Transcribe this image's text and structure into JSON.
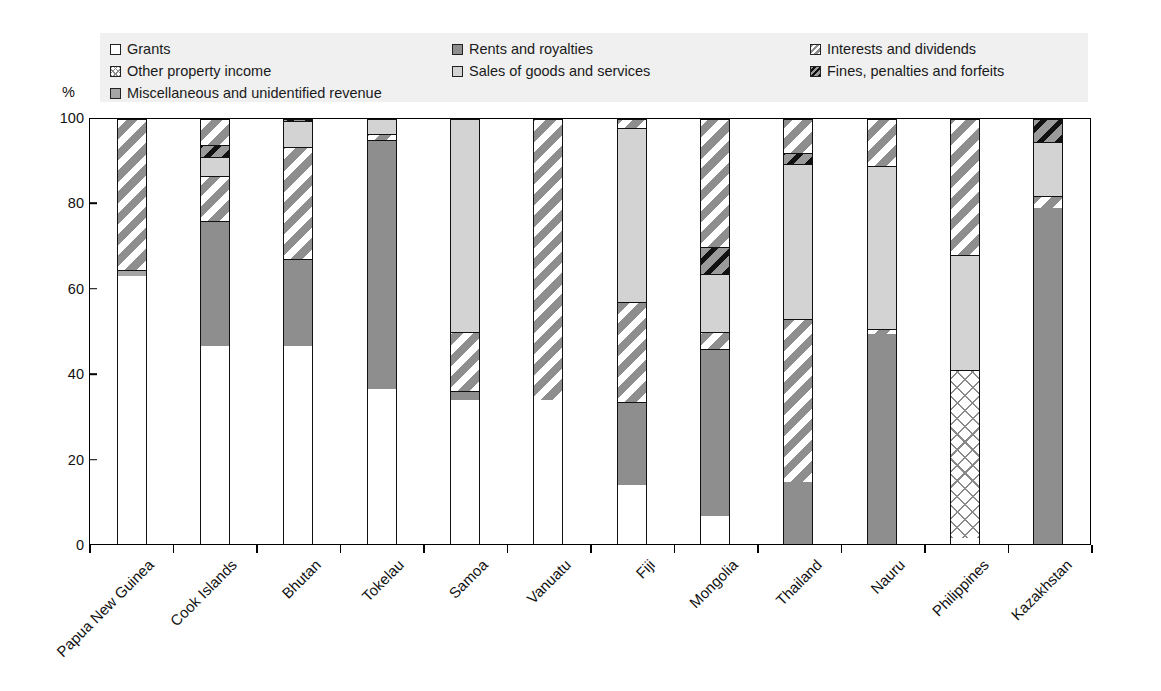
{
  "axis": {
    "unit_label": "%",
    "y_ticks": [
      0,
      20,
      40,
      60,
      80,
      100
    ],
    "y_min": 0,
    "y_max": 100
  },
  "legend": {
    "columns": [
      [
        {
          "label": "Grants",
          "pattern": "p-white",
          "icon": "legend-swatch-grants"
        },
        {
          "label": "Other property income",
          "pattern": "p-crosshatch",
          "icon": "legend-swatch-other-property-income"
        },
        {
          "label": "Miscellaneous and unidentified revenue",
          "pattern": "p-midgray",
          "icon": "legend-swatch-miscellaneous"
        }
      ],
      [
        {
          "label": "Rents and royalties",
          "pattern": "p-solidgray",
          "icon": "legend-swatch-rents-and-royalties"
        },
        {
          "label": "Sales of goods and services",
          "pattern": "p-lightgray",
          "icon": "legend-swatch-sales-of-goods-and-services"
        }
      ],
      [
        {
          "label": "Interests and dividends",
          "pattern": "p-diaghatch",
          "icon": "legend-swatch-interests-and-dividends"
        },
        {
          "label": "Fines, penalties and forfeits",
          "pattern": "p-darkdiag",
          "icon": "legend-swatch-fines-penalties-and-forfeits"
        }
      ]
    ]
  },
  "chart_data": {
    "type": "bar",
    "subtype": "stacked-100-percent",
    "title": "",
    "xlabel": "",
    "ylabel": "%",
    "ylim": [
      0,
      100
    ],
    "grid": false,
    "legend_position": "top",
    "categories": [
      "Papua New Guinea",
      "Cook Islands",
      "Bhutan",
      "Tokelau",
      "Samoa",
      "Vanuatu",
      "Fiji",
      "Mongolia",
      "Thailand",
      "Nauru",
      "Philippines",
      "Kazakhstan"
    ],
    "series": [
      {
        "name": "Grants",
        "pattern": "p-white",
        "values": [
          63.0,
          46.5,
          46.5,
          36.5,
          34.0,
          34.0,
          14.0,
          6.5,
          0.0,
          0.0,
          1.5,
          0.0
        ]
      },
      {
        "name": "Other property income",
        "pattern": "p-crosshatch",
        "values": [
          0.0,
          0.0,
          0.0,
          0.0,
          0.0,
          0.0,
          0.0,
          0.0,
          0.0,
          0.0,
          39.5,
          0.0
        ]
      },
      {
        "name": "Rents and royalties",
        "pattern": "p-solidgray",
        "values": [
          1.0,
          29.5,
          20.5,
          58.5,
          2.0,
          0.0,
          19.5,
          39.5,
          14.5,
          49.5,
          0.0,
          79.0
        ]
      },
      {
        "name": "Sales of goods and services",
        "pattern": "p-lightgray",
        "values": [
          0.0,
          4.5,
          6.0,
          3.5,
          50.0,
          0.0,
          41.0,
          13.5,
          36.5,
          38.5,
          27.0,
          12.5
        ]
      },
      {
        "name": "Interests and dividends",
        "pattern": "p-diaghatch",
        "values": [
          35.0,
          10.5,
          26.5,
          1.5,
          14.0,
          66.0,
          23.5,
          4.0,
          38.5,
          1.0,
          0.0,
          3.0
        ]
      },
      {
        "name": "Fines, penalties and forfeits",
        "pattern": "p-darkdiag",
        "values": [
          0.0,
          3.0,
          0.5,
          0.0,
          0.0,
          0.0,
          0.0,
          6.5,
          2.5,
          0.0,
          0.0,
          5.5
        ]
      },
      {
        "name": "Miscellaneous and unidentified revenue",
        "pattern": "p-midgray",
        "values": [
          1.0,
          6.0,
          0.0,
          0.0,
          0.0,
          0.0,
          2.0,
          30.0,
          8.0,
          11.0,
          32.0,
          0.0
        ]
      }
    ],
    "stack_order": [
      "Grants",
      "Other property income",
      "Rents and royalties",
      "Sales of goods and services",
      "Interests and dividends",
      "Fines, penalties and forfeits",
      "Miscellaneous and unidentified revenue"
    ],
    "per_bar_stacks": [
      {
        "category": "Papua New Guinea",
        "segments": [
          {
            "name": "Grants",
            "pattern": "p-white",
            "from": 0,
            "to": 63
          },
          {
            "name": "Miscellaneous and unidentified revenue",
            "pattern": "p-midgray",
            "from": 63,
            "to": 64.5
          },
          {
            "name": "Interests and dividends",
            "pattern": "p-diaghatch",
            "from": 64.5,
            "to": 100
          }
        ]
      },
      {
        "category": "Cook Islands",
        "segments": [
          {
            "name": "Grants",
            "pattern": "p-white",
            "from": 0,
            "to": 46.5
          },
          {
            "name": "Rents and royalties",
            "pattern": "p-solidgray",
            "from": 46.5,
            "to": 76
          },
          {
            "name": "Interests and dividends",
            "pattern": "p-diaghatch",
            "from": 76,
            "to": 86.5
          },
          {
            "name": "Sales of goods and services",
            "pattern": "p-lightgray",
            "from": 86.5,
            "to": 91
          },
          {
            "name": "Fines, penalties and forfeits",
            "pattern": "p-darkdiag",
            "from": 91,
            "to": 94
          },
          {
            "name": "Miscellaneous and unidentified revenue",
            "pattern": "p-diaghatch",
            "from": 94,
            "to": 100
          }
        ]
      },
      {
        "category": "Bhutan",
        "segments": [
          {
            "name": "Grants",
            "pattern": "p-white",
            "from": 0,
            "to": 46.5
          },
          {
            "name": "Rents and royalties",
            "pattern": "p-solidgray",
            "from": 46.5,
            "to": 67
          },
          {
            "name": "Interests and dividends",
            "pattern": "p-diaghatch",
            "from": 67,
            "to": 93.5
          },
          {
            "name": "Sales of goods and services",
            "pattern": "p-lightgray",
            "from": 93.5,
            "to": 99.5
          },
          {
            "name": "Fines, penalties and forfeits",
            "pattern": "p-darkdiag",
            "from": 99.5,
            "to": 100
          }
        ]
      },
      {
        "category": "Tokelau",
        "segments": [
          {
            "name": "Grants",
            "pattern": "p-white",
            "from": 0,
            "to": 36.5
          },
          {
            "name": "Rents and royalties",
            "pattern": "p-solidgray",
            "from": 36.5,
            "to": 95
          },
          {
            "name": "Interests and dividends",
            "pattern": "p-diaghatch",
            "from": 95,
            "to": 96.5
          },
          {
            "name": "Sales of goods and services",
            "pattern": "p-lightgray",
            "from": 96.5,
            "to": 100
          }
        ]
      },
      {
        "category": "Samoa",
        "segments": [
          {
            "name": "Grants",
            "pattern": "p-white",
            "from": 0,
            "to": 34
          },
          {
            "name": "Rents and royalties",
            "pattern": "p-solidgray",
            "from": 34,
            "to": 36
          },
          {
            "name": "Interests and dividends",
            "pattern": "p-diaghatch",
            "from": 36,
            "to": 50
          },
          {
            "name": "Sales of goods and services",
            "pattern": "p-lightgray",
            "from": 50,
            "to": 100
          }
        ]
      },
      {
        "category": "Vanuatu",
        "segments": [
          {
            "name": "Grants",
            "pattern": "p-white",
            "from": 0,
            "to": 34
          },
          {
            "name": "Interests and dividends",
            "pattern": "p-diaghatch",
            "from": 34,
            "to": 100
          }
        ]
      },
      {
        "category": "Fiji",
        "segments": [
          {
            "name": "Grants",
            "pattern": "p-white",
            "from": 0,
            "to": 14
          },
          {
            "name": "Rents and royalties",
            "pattern": "p-solidgray",
            "from": 14,
            "to": 33.5
          },
          {
            "name": "Interests and dividends",
            "pattern": "p-diaghatch",
            "from": 33.5,
            "to": 57
          },
          {
            "name": "Sales of goods and services",
            "pattern": "p-lightgray",
            "from": 57,
            "to": 98
          },
          {
            "name": "Miscellaneous and unidentified revenue",
            "pattern": "p-diaghatch",
            "from": 98,
            "to": 100
          }
        ]
      },
      {
        "category": "Mongolia",
        "segments": [
          {
            "name": "Grants",
            "pattern": "p-white",
            "from": 0,
            "to": 6.5
          },
          {
            "name": "Rents and royalties",
            "pattern": "p-solidgray",
            "from": 6.5,
            "to": 46
          },
          {
            "name": "Interests and dividends",
            "pattern": "p-diaghatch",
            "from": 46,
            "to": 50
          },
          {
            "name": "Sales of goods and services",
            "pattern": "p-lightgray",
            "from": 50,
            "to": 63.5
          },
          {
            "name": "Fines, penalties and forfeits",
            "pattern": "p-darkdiag",
            "from": 63.5,
            "to": 70
          },
          {
            "name": "Miscellaneous and unidentified revenue",
            "pattern": "p-diaghatch",
            "from": 70,
            "to": 100
          }
        ]
      },
      {
        "category": "Thailand",
        "segments": [
          {
            "name": "Rents and royalties",
            "pattern": "p-solidgray",
            "from": 0,
            "to": 14.5
          },
          {
            "name": "Interests and dividends",
            "pattern": "p-diaghatch",
            "from": 14.5,
            "to": 53
          },
          {
            "name": "Sales of goods and services",
            "pattern": "p-lightgray",
            "from": 53,
            "to": 89.5
          },
          {
            "name": "Fines, penalties and forfeits",
            "pattern": "p-darkdiag",
            "from": 89.5,
            "to": 92
          },
          {
            "name": "Miscellaneous and unidentified revenue",
            "pattern": "p-diaghatch",
            "from": 92,
            "to": 100
          }
        ]
      },
      {
        "category": "Nauru",
        "segments": [
          {
            "name": "Rents and royalties",
            "pattern": "p-solidgray",
            "from": 0,
            "to": 49.5
          },
          {
            "name": "Interests and dividends",
            "pattern": "p-diaghatch",
            "from": 49.5,
            "to": 50.5
          },
          {
            "name": "Sales of goods and services",
            "pattern": "p-lightgray",
            "from": 50.5,
            "to": 89
          },
          {
            "name": "Miscellaneous and unidentified revenue",
            "pattern": "p-diaghatch",
            "from": 89,
            "to": 100
          }
        ]
      },
      {
        "category": "Philippines",
        "segments": [
          {
            "name": "Grants",
            "pattern": "p-white",
            "from": 0,
            "to": 1.5
          },
          {
            "name": "Other property income",
            "pattern": "p-crosshatch",
            "from": 1.5,
            "to": 41
          },
          {
            "name": "Sales of goods and services",
            "pattern": "p-lightgray",
            "from": 41,
            "to": 68
          },
          {
            "name": "Miscellaneous and unidentified revenue",
            "pattern": "p-diaghatch",
            "from": 68,
            "to": 100
          }
        ]
      },
      {
        "category": "Kazakhstan",
        "segments": [
          {
            "name": "Rents and royalties",
            "pattern": "p-solidgray",
            "from": 0,
            "to": 79
          },
          {
            "name": "Interests and dividends",
            "pattern": "p-diaghatch",
            "from": 79,
            "to": 82
          },
          {
            "name": "Sales of goods and services",
            "pattern": "p-lightgray",
            "from": 82,
            "to": 94.5
          },
          {
            "name": "Fines, penalties and forfeits",
            "pattern": "p-darkdiag",
            "from": 94.5,
            "to": 100
          }
        ]
      }
    ]
  }
}
